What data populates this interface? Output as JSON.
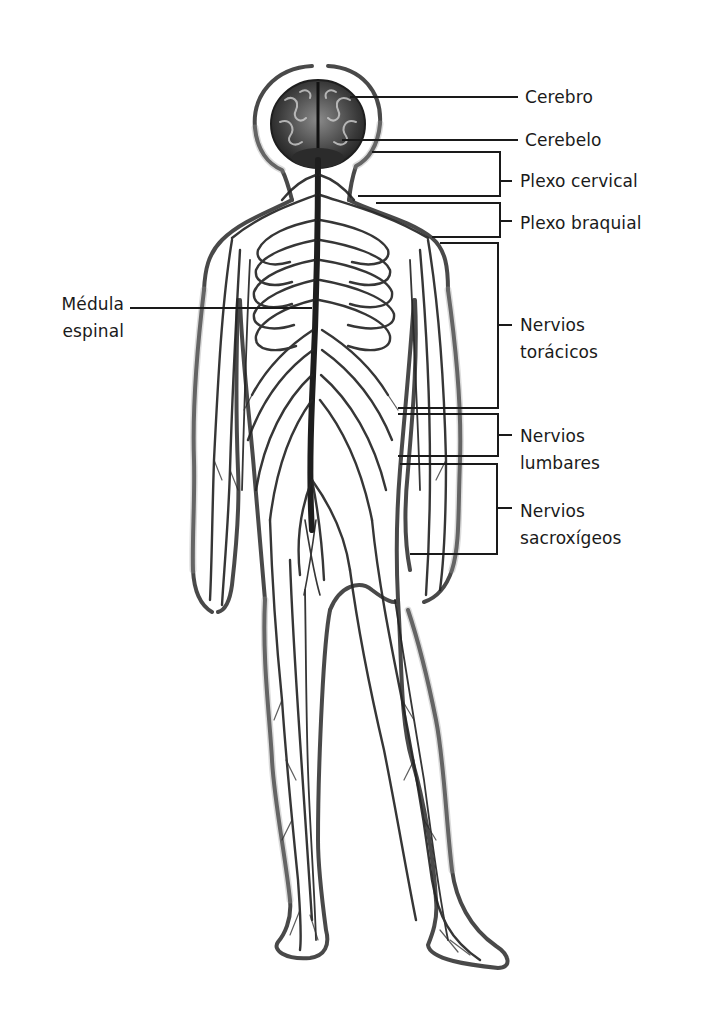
{
  "diagram": {
    "type": "anatomical-illustration",
    "line_color": "#1a1a1a",
    "background": "#ffffff"
  },
  "labels": {
    "cerebro": {
      "lines": [
        "Cerebro"
      ]
    },
    "cerebelo": {
      "lines": [
        "Cerebelo"
      ]
    },
    "plexo_cervical": {
      "lines": [
        "Plexo cervical"
      ]
    },
    "plexo_braquial": {
      "lines": [
        "Plexo braquial"
      ]
    },
    "medula_espinal": {
      "lines": [
        "Médula",
        "espinal"
      ]
    },
    "nervios_toracicos": {
      "lines": [
        "Nervios",
        "torácicos"
      ]
    },
    "nervios_lumbares": {
      "lines": [
        "Nervios",
        "lumbares"
      ]
    },
    "nervios_sacroxigeos": {
      "lines": [
        "Nervios",
        "sacroxígeos"
      ]
    }
  }
}
